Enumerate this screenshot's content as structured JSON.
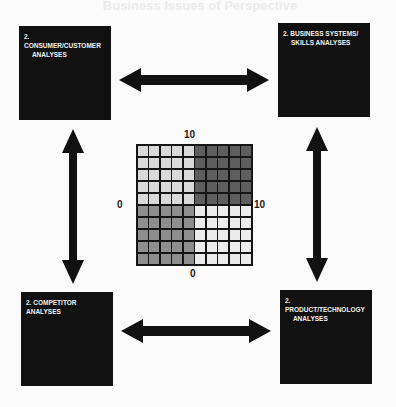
{
  "diagram": {
    "title_bleed": "Business Issues of Perspective",
    "boxes": {
      "top_left": {
        "number": "2.",
        "line1": "CONSUMER/CUSTOMER",
        "line2": "ANALYSES"
      },
      "top_right": {
        "number": "2.",
        "line1": "BUSINESS SYSTEMS/",
        "line2": "SKILLS ANALYSES"
      },
      "bottom_left": {
        "number": "2.",
        "line1": "COMPETITOR ANALYSES",
        "line2": ""
      },
      "bottom_right": {
        "number": "2.",
        "line1": "PRODUCT/TECHNOLOGY",
        "line2": "ANALYSES"
      }
    },
    "arrows": [
      {
        "id": "top",
        "from": "top_left",
        "to": "top_right",
        "direction": "bidirectional"
      },
      {
        "id": "bottom",
        "from": "bottom_left",
        "to": "bottom_right",
        "direction": "bidirectional"
      },
      {
        "id": "left",
        "from": "top_left",
        "to": "bottom_left",
        "direction": "bidirectional"
      },
      {
        "id": "right",
        "from": "top_right",
        "to": "bottom_right",
        "direction": "bidirectional"
      }
    ],
    "matrix": {
      "rows": 10,
      "cols": 10,
      "axis_labels": {
        "top": "10",
        "bottom": "0",
        "left": "0",
        "right": "10"
      },
      "quadrant_colors": {
        "top_left": "#d9d9d9",
        "top_right": "#5e5e5e",
        "bottom_left": "#8e8e8e",
        "bottom_right": "#ececec"
      }
    },
    "colors": {
      "box_fill": "#111111",
      "box_text": "#f2f2f2",
      "arrow": "#111111",
      "background": "#fbfbfb",
      "grid_line": "#151515"
    }
  }
}
